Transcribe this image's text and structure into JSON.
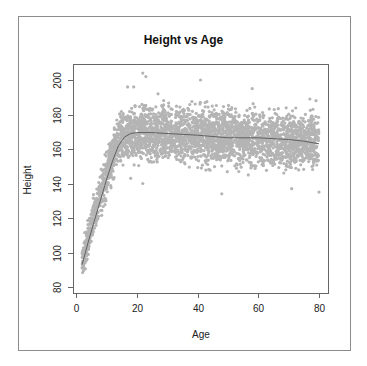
{
  "chart_data": {
    "type": "scatter",
    "title": "Height vs Age",
    "xlabel": "Age",
    "ylabel": "Height",
    "xlim": [
      0,
      82
    ],
    "ylim": [
      78,
      206
    ],
    "x_ticks": [
      0,
      20,
      40,
      60,
      80
    ],
    "y_ticks": [
      80,
      100,
      120,
      140,
      160,
      180,
      200
    ],
    "grid": false,
    "legend": null,
    "series": [
      {
        "name": "observations",
        "kind": "points",
        "color": "#b4b4b4",
        "description": "Dense cloud of several thousand points; ages ~2-80; heights rise steeply from ~85-105 at age 2 to a plateau ~145-190 after age ~17, with outliers up to ~204 and down to ~135",
        "band": [
          {
            "x": 2,
            "low": 83,
            "high": 105
          },
          {
            "x": 5,
            "low": 100,
            "high": 130
          },
          {
            "x": 8,
            "low": 115,
            "high": 150
          },
          {
            "x": 11,
            "low": 132,
            "high": 170
          },
          {
            "x": 14,
            "low": 145,
            "high": 185
          },
          {
            "x": 18,
            "low": 147,
            "high": 190
          },
          {
            "x": 30,
            "low": 147,
            "high": 190
          },
          {
            "x": 50,
            "low": 145,
            "high": 189
          },
          {
            "x": 70,
            "low": 144,
            "high": 187
          },
          {
            "x": 80,
            "low": 142,
            "high": 186
          }
        ],
        "outliers": [
          {
            "x": 22,
            "y": 204
          },
          {
            "x": 23,
            "y": 202
          },
          {
            "x": 19,
            "y": 196
          },
          {
            "x": 17,
            "y": 196
          },
          {
            "x": 41,
            "y": 200
          },
          {
            "x": 58,
            "y": 195
          },
          {
            "x": 27,
            "y": 192
          },
          {
            "x": 77,
            "y": 189
          },
          {
            "x": 79,
            "y": 188
          },
          {
            "x": 48,
            "y": 134
          },
          {
            "x": 71,
            "y": 137
          },
          {
            "x": 80,
            "y": 135
          },
          {
            "x": 18,
            "y": 143
          },
          {
            "x": 22,
            "y": 140
          }
        ]
      },
      {
        "name": "smoothed trend",
        "kind": "line",
        "color": "#606060",
        "x": [
          2,
          4,
          6,
          8,
          10,
          12,
          14,
          16,
          18,
          20,
          25,
          30,
          40,
          50,
          60,
          70,
          75,
          80
        ],
        "y": [
          93,
          106,
          118,
          130,
          142,
          153,
          162,
          167,
          169,
          169.5,
          169.5,
          169,
          168,
          166.5,
          166.5,
          165.5,
          164.5,
          163
        ]
      }
    ]
  }
}
